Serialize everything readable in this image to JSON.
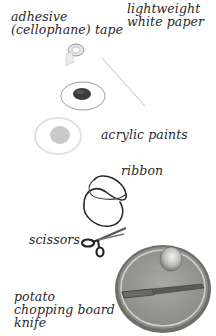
{
  "items": [
    {
      "id": "tape",
      "lines": [
        "adhesive",
        "(cellophane) tape"
      ]
    },
    {
      "id": "paper",
      "lines": [
        "lightweight",
        "white paper"
      ]
    },
    {
      "id": "paints",
      "lines": [
        "acrylic paints"
      ]
    },
    {
      "id": "ribbon",
      "lines": [
        "ribbon"
      ]
    },
    {
      "id": "scissors",
      "lines": [
        "scissors"
      ]
    },
    {
      "id": "board",
      "lines": [
        "potato",
        "chopping board",
        "knife"
      ]
    }
  ],
  "colors": {
    "background": "#ffffff",
    "text": "#2a2a2a",
    "board_wood": "#9a9a96",
    "board_rim": "#c8c8c4",
    "paint_blob": "#c9c9c9",
    "dark_paint": "#3a3a3a"
  }
}
